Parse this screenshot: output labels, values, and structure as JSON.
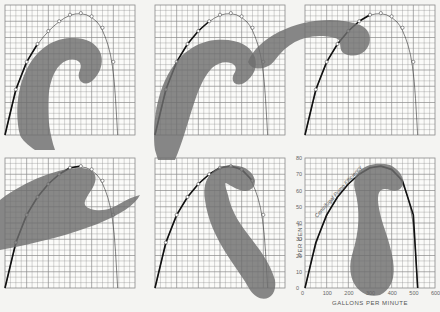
{
  "figure": {
    "panel_count": 6,
    "colors": {
      "background": "#f4f4f2",
      "grid": "#8a8a8a",
      "curve": "#111111",
      "french_curve": "#6e6e6e",
      "points": "#ffffff"
    }
  },
  "panels": [
    {
      "id": 1,
      "position": "top-left",
      "step": "fit curve to first points"
    },
    {
      "id": 2,
      "position": "top-middle",
      "step": "extend curve"
    },
    {
      "id": 3,
      "position": "top-right",
      "step": "fit near peak"
    },
    {
      "id": 4,
      "position": "bottom-left",
      "step": "curve across peak"
    },
    {
      "id": 5,
      "position": "bottom-middle",
      "step": "fit descending side"
    },
    {
      "id": 6,
      "position": "bottom-right",
      "step": "completed curve with labels"
    }
  ],
  "final_chart": {
    "curve_label": "Centrifugal Pump Efficiency",
    "ylabel": "PER CENT",
    "xlabel": "GALLONS PER MINUTE",
    "y_ticks": [
      "0",
      "10",
      "20",
      "30",
      "40",
      "50",
      "60",
      "70",
      "80"
    ],
    "x_ticks": [
      "0",
      "100",
      "200",
      "300",
      "400",
      "500",
      "600"
    ]
  },
  "chart_data": {
    "type": "line",
    "title": "Centrifugal Pump Efficiency",
    "xlabel": "GALLONS PER MINUTE",
    "ylabel": "PER CENT",
    "xlim": [
      0,
      600
    ],
    "ylim": [
      0,
      80
    ],
    "grid": true,
    "x": [
      0,
      50,
      100,
      150,
      200,
      250,
      300,
      350,
      400,
      450,
      500,
      520
    ],
    "series": [
      {
        "name": "Centrifugal Pump Efficiency",
        "values": [
          0,
          28,
          45,
          56,
          64,
          70,
          74,
          75,
          73,
          66,
          45,
          0
        ]
      }
    ]
  }
}
